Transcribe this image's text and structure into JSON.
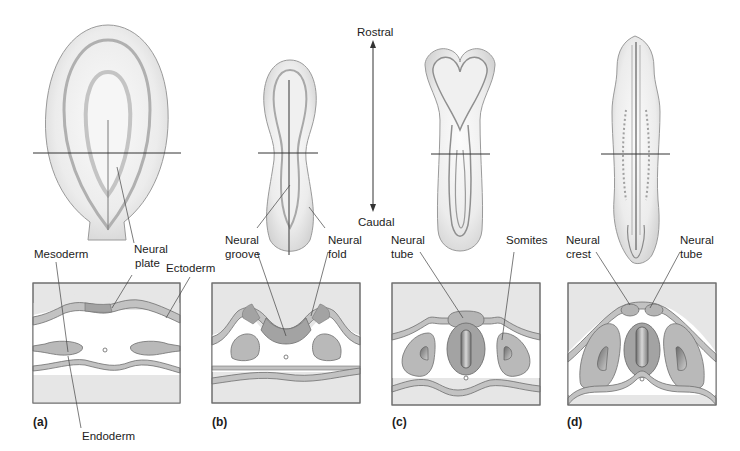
{
  "figure": {
    "orientation": {
      "top_label": "Rostral",
      "bottom_label": "Caudal"
    },
    "colors": {
      "box_fill": "#e6e6e6",
      "box_stroke": "#6f6f6f",
      "ectoderm_fill": "#c2c2c2",
      "neural_fill": "#a3a3a3",
      "mesoderm_fill": "#b9b9b9",
      "cavity_fill": "#ffffff",
      "embryo_fill": "#f2f2f2",
      "embryo_stroke": "#8a8a8a"
    },
    "panels": [
      {
        "tag": "(a)",
        "labels": {
          "mesoderm": "Mesoderm",
          "neural_plate_1": "Neural",
          "neural_plate_2": "plate",
          "ectoderm": "Ectoderm",
          "endoderm": "Endoderm"
        }
      },
      {
        "tag": "(b)",
        "labels": {
          "neural_groove_1": "Neural",
          "neural_groove_2": "groove",
          "neural_fold_1": "Neural",
          "neural_fold_2": "fold"
        }
      },
      {
        "tag": "(c)",
        "labels": {
          "neural_tube_1": "Neural",
          "neural_tube_2": "tube",
          "somites": "Somites"
        }
      },
      {
        "tag": "(d)",
        "labels": {
          "neural_crest_1": "Neural",
          "neural_crest_2": "crest",
          "neural_tube_1": "Neural",
          "neural_tube_2": "tube"
        }
      }
    ]
  }
}
